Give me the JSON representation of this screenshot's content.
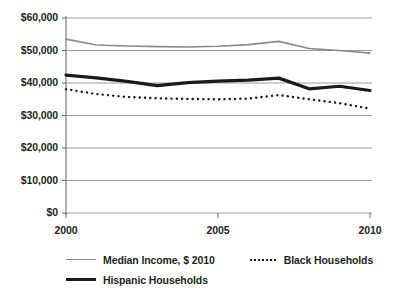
{
  "chart_data": {
    "type": "line",
    "title": "",
    "xlabel": "",
    "ylabel": "",
    "x": [
      2000,
      2001,
      2002,
      2003,
      2004,
      2005,
      2006,
      2007,
      2008,
      2009,
      2010
    ],
    "xlim": [
      2000,
      2010
    ],
    "ylim": [
      0,
      60000
    ],
    "grid": true,
    "legend_position": "bottom",
    "series": [
      {
        "name": "Median Income, $ 2010",
        "style": "thin-gray-line",
        "color": "#8a8a8a",
        "values": [
          53500,
          51700,
          51400,
          51200,
          51100,
          51300,
          51800,
          52800,
          50600,
          50000,
          49200
        ]
      },
      {
        "name": "Black Households",
        "style": "dotted-line",
        "color": "#1a1a1a",
        "values": [
          38100,
          36600,
          35700,
          35300,
          35100,
          35000,
          35200,
          36300,
          35000,
          33800,
          32100
        ]
      },
      {
        "name": "Hispanic Households",
        "style": "thick-black-line",
        "color": "#1a1a1a",
        "values": [
          42400,
          41600,
          40500,
          39200,
          40100,
          40600,
          40900,
          41500,
          38200,
          39000,
          37700
        ]
      }
    ],
    "yticks": [
      {
        "value": 60000,
        "label": "$60,000"
      },
      {
        "value": 50000,
        "label": "$50,000"
      },
      {
        "value": 40000,
        "label": "$40,000"
      },
      {
        "value": 30000,
        "label": "$30,000"
      },
      {
        "value": 20000,
        "label": "$20,000"
      },
      {
        "value": 10000,
        "label": "$10,000"
      },
      {
        "value": 0,
        "label": "$0"
      }
    ],
    "xticks": [
      {
        "value": 2000,
        "label": "2000"
      },
      {
        "value": 2005,
        "label": "2005"
      },
      {
        "value": 2010,
        "label": "2010"
      }
    ],
    "legend": [
      {
        "label": "Median Income, $ 2010",
        "swatch": "thin-gray-line"
      },
      {
        "label": "Black Households",
        "swatch": "dotted-line"
      },
      {
        "label": "Hispanic Households",
        "swatch": "thick-black-line"
      }
    ]
  },
  "colors": {
    "background": "#ffffff",
    "gridline": "#8e8e8e",
    "axis": "#6f6f6f",
    "text": "#231f20",
    "median_line": "#8a8a8a",
    "hispanic_line": "#1a1a1a",
    "black_line": "#1a1a1a"
  }
}
